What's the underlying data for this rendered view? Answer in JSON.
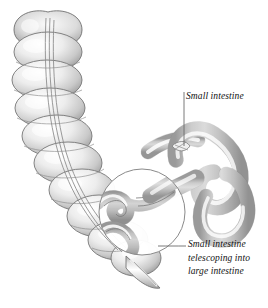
{
  "figure": {
    "kind": "medical-illustration",
    "background_color": "#ffffff",
    "ink_color": "#111111"
  },
  "labels": {
    "small_intestine": {
      "text": "Small intestine",
      "leader": "vertical-line-down"
    },
    "telescoping": {
      "line1": "Small intestine",
      "line2": "telescoping into",
      "line3": "large intestine",
      "leader": "horizontal-line-left"
    }
  },
  "anatomy": {
    "large_intestine": "large-intestine-haustra",
    "small_intestine": "small-intestine-loops",
    "appendix": "appendix-tip",
    "taenia_coli": "taenia-coli-band",
    "cutaway": "cutaway-circle",
    "telescoped_bowel": "telescoped-bowel-inside-cutaway"
  },
  "palette": {
    "outline": "#6f6f6f",
    "circle_stroke": "#8a8a8a",
    "shade_dark": "#9a9a9a",
    "shade_mid": "#c4c4c4",
    "shade_light": "#e9e9e9",
    "highlight": "#ffffff",
    "leader": "#6b6b6b"
  }
}
